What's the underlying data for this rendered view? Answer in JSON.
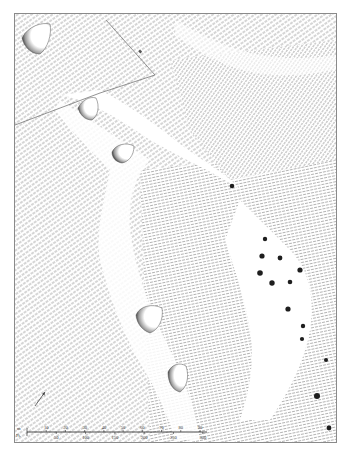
{
  "map": {
    "title": "",
    "type": "hachured earthwork survey plan",
    "features": {
      "barrows": [
        {
          "id": "barrow-1"
        },
        {
          "id": "barrow-2"
        },
        {
          "id": "barrow-3"
        },
        {
          "id": "barrow-4"
        },
        {
          "id": "barrow-5"
        }
      ],
      "pits_count": 14
    },
    "north_arrow": {
      "label": ""
    },
    "scale_bar": {
      "metres_unit": "m",
      "feet_unit": "Ft.",
      "metres_ticks": [
        "10",
        "20",
        "30",
        "40",
        "50",
        "60",
        "70",
        "80",
        "90"
      ],
      "feet_ticks": [
        "50",
        "100",
        "150",
        "200",
        "250",
        "300"
      ]
    },
    "colors": {
      "ink": "#555555",
      "pit": "#1e1e1e",
      "frame": "#8a8a8a"
    }
  }
}
